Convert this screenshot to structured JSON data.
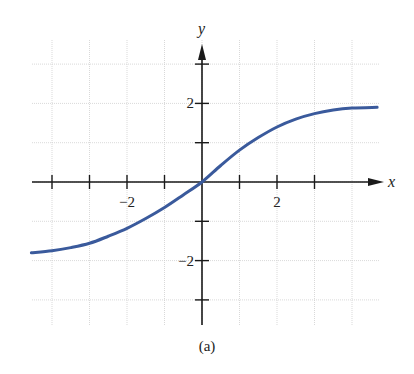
{
  "chart_data": {
    "type": "line",
    "title": "",
    "caption": "(a)",
    "xlabel": "x",
    "ylabel": "y",
    "xlim": [
      -4.55,
      4.67
    ],
    "ylim": [
      -3.6,
      3.6
    ],
    "grid": true,
    "x_ticks": [
      -4,
      -3,
      -2,
      -1,
      1,
      2,
      3
    ],
    "x_tick_labels": [
      {
        "value": -2,
        "label": "−2"
      },
      {
        "value": 2,
        "label": "2"
      }
    ],
    "y_ticks": [
      -3,
      -2,
      -1,
      1,
      2,
      3
    ],
    "y_tick_labels": [
      {
        "value": 2,
        "label": "2"
      },
      {
        "value": -2,
        "label": "−2"
      }
    ],
    "series": [
      {
        "name": "curve",
        "color": "#3a5a9c",
        "x": [
          -4.55,
          -4,
          -3.5,
          -3,
          -2.5,
          -2,
          -1.5,
          -1,
          -0.5,
          0,
          0.5,
          1,
          1.5,
          2,
          2.5,
          3,
          3.5,
          4,
          4.67
        ],
        "y": [
          -1.8,
          -1.75,
          -1.67,
          -1.56,
          -1.38,
          -1.18,
          -0.93,
          -0.65,
          -0.33,
          0,
          0.42,
          0.81,
          1.13,
          1.4,
          1.6,
          1.74,
          1.83,
          1.88,
          1.9
        ]
      }
    ]
  },
  "layout": {
    "origin_px": [
      202,
      182
    ],
    "x_unit_px": 37.5,
    "y_unit_px": 39.3,
    "grid_px": {
      "left": 32,
      "right": 380,
      "top": 40,
      "bottom": 325
    }
  },
  "labels": {
    "x_axis": "x",
    "y_axis": "y",
    "caption": "(a)"
  }
}
